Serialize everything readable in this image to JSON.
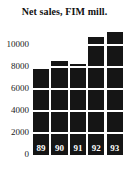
{
  "chart_data": {
    "type": "bar",
    "title": "Net sales, FIM mill.",
    "xlabel": "",
    "ylabel": "",
    "categories": [
      "89",
      "90",
      "91",
      "92",
      "93"
    ],
    "values": [
      7800,
      8550,
      8300,
      10700,
      11200
    ],
    "yticks": [
      "0",
      "2000",
      "4000",
      "6000",
      "8000",
      "10000"
    ],
    "ytick_values": [
      0,
      2000,
      4000,
      6000,
      8000,
      10000
    ],
    "ylim": [
      0,
      11600
    ],
    "grid": true,
    "legend": "none",
    "bar_color": "#151515",
    "bar_label_color": "#ffffff",
    "text_color": "#111111",
    "background": "#ffffff"
  }
}
